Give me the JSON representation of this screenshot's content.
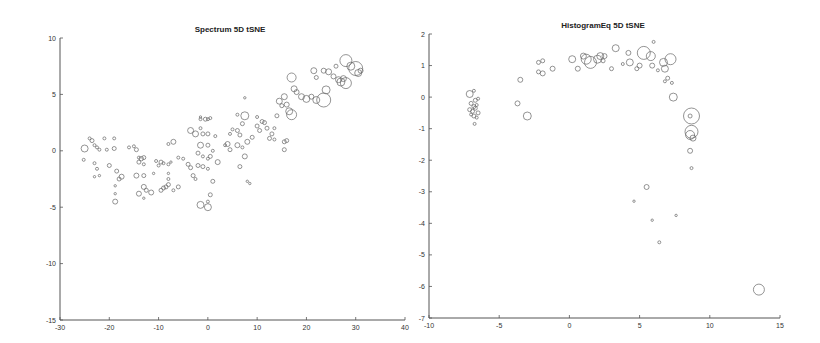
{
  "chart_data": [
    {
      "type": "scatter",
      "title": "Spectrum 5D tSNE",
      "xlabel": "",
      "ylabel": "",
      "xlim": [
        -30,
        40
      ],
      "ylim": [
        -15,
        10
      ],
      "xticks": [
        -30,
        -20,
        -10,
        0,
        10,
        20,
        30,
        40
      ],
      "yticks": [
        -15,
        -10,
        -5,
        0,
        5,
        10
      ],
      "grid": false,
      "legend": null,
      "marker": "open circle, size varies",
      "points": [
        [
          -25,
          0.2,
          3.5
        ],
        [
          -25.2,
          -0.8,
          1.5
        ],
        [
          -24,
          1.1,
          1.5
        ],
        [
          -23.5,
          0.9,
          2
        ],
        [
          -23,
          0.5,
          1.5
        ],
        [
          -22.5,
          0.3,
          1.5
        ],
        [
          -23,
          -1.1,
          1.5
        ],
        [
          -22.5,
          -1.6,
          1.5
        ],
        [
          -23,
          -2.3,
          1.2
        ],
        [
          -22,
          -2.2,
          1.2
        ],
        [
          -22,
          0.1,
          1.5
        ],
        [
          -21,
          1.1,
          1.5
        ],
        [
          -20.5,
          0.1,
          1.5
        ],
        [
          -20,
          -1.3,
          2
        ],
        [
          -19,
          0.2,
          2
        ],
        [
          -19,
          1.1,
          1.5
        ],
        [
          -18.5,
          -1.8,
          2
        ],
        [
          -18,
          -2.5,
          2
        ],
        [
          -18.8,
          -3.1,
          1.2
        ],
        [
          -18.8,
          -3.8,
          1.2
        ],
        [
          -18.8,
          -4.5,
          2.5
        ],
        [
          -17.5,
          -2.3,
          2.5
        ],
        [
          -16,
          0.3,
          1.5
        ],
        [
          -15,
          0.4,
          1.5
        ],
        [
          -14.5,
          0.1,
          2
        ],
        [
          -14,
          -0.6,
          1.5
        ],
        [
          -14,
          -1.0,
          2
        ],
        [
          -13.5,
          -0.7,
          2.2
        ],
        [
          -13,
          -0.6,
          2
        ],
        [
          -13,
          -1.2,
          1.5
        ],
        [
          -14.5,
          -2.2,
          2.5
        ],
        [
          -13,
          -2.2,
          2
        ],
        [
          -13,
          -3.2,
          2.5
        ],
        [
          -14,
          -3.8,
          2.5
        ],
        [
          -13,
          -4.2,
          1.2
        ],
        [
          -12.5,
          -3.5,
          2
        ],
        [
          -11.5,
          -3.7,
          2.5
        ],
        [
          -11,
          -2.0,
          1.2
        ],
        [
          -10.5,
          -0.9,
          1.5
        ],
        [
          -10,
          -1.3,
          1.5
        ],
        [
          -9.5,
          -1.0,
          2
        ],
        [
          -9,
          -1.1,
          1.5
        ],
        [
          -8,
          -1.2,
          1.5
        ],
        [
          -7.5,
          -1.0,
          1.2
        ],
        [
          -9.5,
          -3.5,
          2
        ],
        [
          -9,
          -3.3,
          2
        ],
        [
          -8.5,
          -3.2,
          2
        ],
        [
          -8,
          -3.0,
          2
        ],
        [
          -8,
          -2.5,
          1.5
        ],
        [
          -7,
          -3.5,
          1.5
        ],
        [
          -6,
          -3.2,
          2
        ],
        [
          -8,
          -2.0,
          1.2
        ],
        [
          -8,
          0.6,
          1.5
        ],
        [
          -7,
          0.8,
          2.5
        ],
        [
          -6,
          -0.6,
          1.5
        ],
        [
          -5,
          -0.7,
          1.5
        ],
        [
          -4,
          -1.2,
          2
        ],
        [
          -3.5,
          -1.5,
          2
        ],
        [
          -3,
          -2.2,
          2
        ],
        [
          -2.5,
          -2.5,
          1.5
        ],
        [
          -3.5,
          1.8,
          3
        ],
        [
          -2.5,
          1.5,
          3
        ],
        [
          -1.5,
          2.0,
          1.5
        ],
        [
          -1.5,
          2.8,
          1.5
        ],
        [
          -1.5,
          3.0,
          1.2
        ],
        [
          -0.5,
          2.8,
          2
        ],
        [
          0,
          2.8,
          1.5
        ],
        [
          0.5,
          2.9,
          1.5
        ],
        [
          -1.5,
          0.5,
          3
        ],
        [
          -1,
          1.5,
          2
        ],
        [
          0,
          1.5,
          2
        ],
        [
          0,
          0.5,
          2
        ],
        [
          -2,
          -0.2,
          2
        ],
        [
          -1,
          -0.5,
          1.5
        ],
        [
          0,
          -0.7,
          1.5
        ],
        [
          0.5,
          -0.5,
          2
        ],
        [
          1,
          0,
          1.5
        ],
        [
          2,
          -1.0,
          2.5
        ],
        [
          -2,
          -1.3,
          2
        ],
        [
          -1,
          -1.4,
          2
        ],
        [
          0,
          -1.6,
          1.5
        ],
        [
          1,
          -2.7,
          2
        ],
        [
          0.5,
          -3.9,
          2
        ],
        [
          -1.5,
          -4.8,
          3.5
        ],
        [
          0,
          -5.0,
          3.5
        ],
        [
          0,
          -4.5,
          1.5
        ],
        [
          1.5,
          1.3,
          1.5
        ],
        [
          3.5,
          0.5,
          1.5
        ],
        [
          4,
          0.6,
          2.5
        ],
        [
          4.5,
          0.1,
          2
        ],
        [
          4.5,
          1.5,
          1.5
        ],
        [
          5,
          1.9,
          1.5
        ],
        [
          6,
          1.8,
          2
        ],
        [
          6.5,
          1.4,
          2
        ],
        [
          7,
          2.4,
          2
        ],
        [
          7.5,
          3.1,
          4
        ],
        [
          6,
          3.2,
          1.5
        ],
        [
          7.5,
          4.7,
          1.2
        ],
        [
          6,
          0.5,
          2.5
        ],
        [
          7,
          0.3,
          1.5
        ],
        [
          7.5,
          -0.5,
          2.5
        ],
        [
          8,
          0.8,
          2.5
        ],
        [
          6.5,
          -1.4,
          2
        ],
        [
          8,
          -2.7,
          1.2
        ],
        [
          8.5,
          -2.9,
          1.2
        ],
        [
          9,
          1.2,
          2
        ],
        [
          10,
          2.2,
          2
        ],
        [
          10.5,
          1.8,
          2
        ],
        [
          10,
          3.0,
          1.5
        ],
        [
          11,
          2.6,
          2
        ],
        [
          11.5,
          2.5,
          2
        ],
        [
          12,
          2.0,
          2
        ],
        [
          12.5,
          1.1,
          2
        ],
        [
          13,
          1.5,
          2
        ],
        [
          13.5,
          1.0,
          1.5
        ],
        [
          13.5,
          2.0,
          1.5
        ],
        [
          14,
          3.1,
          2
        ],
        [
          14.5,
          4.4,
          3
        ],
        [
          15,
          4.0,
          2
        ],
        [
          15.5,
          4.8,
          3
        ],
        [
          16,
          4.1,
          2.5
        ],
        [
          16.5,
          3.5,
          3.5
        ],
        [
          17,
          3.2,
          5
        ],
        [
          15.5,
          0.8,
          2
        ],
        [
          16,
          0.9,
          2
        ],
        [
          15.5,
          0.1,
          2
        ],
        [
          17,
          6.5,
          4.5
        ],
        [
          17.5,
          5.5,
          3
        ],
        [
          18,
          5.2,
          2.5
        ],
        [
          19,
          4.8,
          3
        ],
        [
          20,
          4.6,
          3.5
        ],
        [
          21,
          4.8,
          2.5
        ],
        [
          22,
          4.5,
          3.5
        ],
        [
          23.5,
          4.5,
          7
        ],
        [
          24,
          5.4,
          4
        ],
        [
          21.5,
          7.1,
          3
        ],
        [
          22,
          6.5,
          2
        ],
        [
          23.5,
          7.1,
          2.5
        ],
        [
          24.5,
          7.0,
          3
        ],
        [
          25.5,
          6.6,
          2.5
        ],
        [
          26.5,
          6.3,
          3
        ],
        [
          27,
          6.1,
          4
        ],
        [
          27.5,
          6.4,
          3
        ],
        [
          28,
          6.0,
          5.5
        ],
        [
          28,
          8.0,
          6
        ],
        [
          29,
          7.5,
          4
        ],
        [
          30,
          7.3,
          7
        ],
        [
          30.5,
          6.9,
          3.5
        ],
        [
          31,
          7.1,
          2.5
        ],
        [
          26,
          7.5,
          2
        ]
      ]
    },
    {
      "type": "scatter",
      "title": "HistogramEq 5D tSNE",
      "xlabel": "",
      "ylabel": "",
      "xlim": [
        -10,
        15
      ],
      "ylim": [
        -7,
        2
      ],
      "xticks": [
        -10,
        -5,
        0,
        5,
        10,
        15
      ],
      "yticks": [
        -7,
        -6,
        -5,
        -4,
        -3,
        -2,
        -1,
        0,
        1,
        2
      ],
      "grid": false,
      "legend": null,
      "marker": "open circle, size varies",
      "points": [
        [
          -7.1,
          0.1,
          3.5
        ],
        [
          -6.8,
          0.2,
          1.5
        ],
        [
          -6.7,
          -0.1,
          2
        ],
        [
          -6.5,
          -0.05,
          1.5
        ],
        [
          -7.0,
          -0.2,
          2
        ],
        [
          -6.8,
          -0.3,
          2
        ],
        [
          -7.1,
          -0.4,
          2
        ],
        [
          -6.9,
          -0.45,
          2
        ],
        [
          -6.7,
          -0.35,
          2
        ],
        [
          -6.5,
          -0.5,
          2
        ],
        [
          -6.8,
          -0.6,
          2
        ],
        [
          -7.0,
          -0.55,
          1.5
        ],
        [
          -6.6,
          -0.65,
          1.5
        ],
        [
          -6.75,
          -0.85,
          1.5
        ],
        [
          -6.6,
          -0.25,
          1.5
        ],
        [
          -3.7,
          -0.2,
          2.5
        ],
        [
          -3.5,
          0.55,
          2.5
        ],
        [
          -3.0,
          -0.6,
          4
        ],
        [
          -2.2,
          1.1,
          2
        ],
        [
          -1.9,
          1.15,
          2
        ],
        [
          -2.2,
          0.8,
          2
        ],
        [
          -1.9,
          0.75,
          2.5
        ],
        [
          -1.2,
          0.9,
          2.5
        ],
        [
          0.2,
          1.2,
          3.5
        ],
        [
          0.6,
          0.9,
          2.5
        ],
        [
          1.0,
          1.3,
          3
        ],
        [
          1.2,
          1.2,
          5
        ],
        [
          1.5,
          1.1,
          6
        ],
        [
          2.0,
          1.2,
          4
        ],
        [
          2.2,
          1.3,
          3.5
        ],
        [
          2.5,
          1.3,
          2.5
        ],
        [
          2.4,
          1.15,
          2
        ],
        [
          3.0,
          0.9,
          2
        ],
        [
          3.3,
          1.55,
          3.5
        ],
        [
          3.8,
          1.05,
          1.5
        ],
        [
          4.2,
          1.4,
          2.5
        ],
        [
          4.3,
          1.1,
          3.5
        ],
        [
          4.8,
          0.9,
          2
        ],
        [
          5.0,
          1.0,
          2.5
        ],
        [
          5.3,
          1.4,
          6.5
        ],
        [
          5.8,
          1.3,
          4.5
        ],
        [
          5.9,
          1.0,
          2.5
        ],
        [
          6.0,
          1.75,
          1.5
        ],
        [
          6.3,
          0.85,
          1.5
        ],
        [
          6.7,
          1.1,
          4
        ],
        [
          6.8,
          0.9,
          3.5
        ],
        [
          7.2,
          1.2,
          5.5
        ],
        [
          7.0,
          0.6,
          2
        ],
        [
          6.8,
          0.5,
          1.5
        ],
        [
          7.3,
          0.45,
          1.5
        ],
        [
          7.4,
          0.0,
          4
        ],
        [
          8.7,
          -0.6,
          8
        ],
        [
          8.6,
          -0.6,
          2
        ],
        [
          8.7,
          -1.1,
          6.5
        ],
        [
          8.6,
          -1.2,
          4.5
        ],
        [
          8.8,
          -1.3,
          3
        ],
        [
          8.6,
          -1.7,
          2.5
        ],
        [
          8.7,
          -2.25,
          1.5
        ],
        [
          5.5,
          -2.85,
          2.5
        ],
        [
          4.6,
          -3.3,
          1.2
        ],
        [
          5.9,
          -3.9,
          1.2
        ],
        [
          7.6,
          -3.75,
          1.2
        ],
        [
          6.4,
          -4.6,
          1.5
        ],
        [
          13.5,
          -6.1,
          5.5
        ]
      ]
    }
  ],
  "panels": [
    {
      "title": "Spectrum 5D tSNE"
    },
    {
      "title": "HistogramEq 5D tSNE"
    }
  ]
}
